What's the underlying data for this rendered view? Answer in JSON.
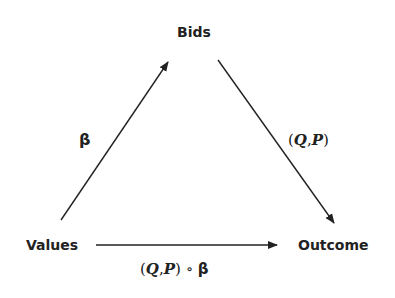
{
  "diagram": {
    "nodes": {
      "bids": "Bids",
      "values": "Values",
      "outcome": "Outcome"
    },
    "edges": [
      {
        "from": "Values",
        "to": "Bids",
        "label": "β"
      },
      {
        "from": "Bids",
        "to": "Outcome",
        "label": "(Q,P)"
      },
      {
        "from": "Values",
        "to": "Outcome",
        "label": "(Q,P) ∘ β"
      }
    ],
    "labels": {
      "beta": "β",
      "qp_open": "(",
      "q": "Q",
      "comma": ",",
      "p": "P",
      "qp_close": ")",
      "compose": " ∘ ",
      "beta2": "β"
    }
  }
}
